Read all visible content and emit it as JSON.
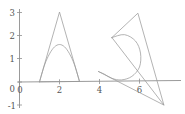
{
  "figure": {
    "title": "",
    "width_px": 185,
    "height_px": 114,
    "background_color": "#ffffff",
    "axis_color": "#8f8f8f",
    "curve_color": "#9a9a9a",
    "label_color": "#555555"
  },
  "axes": {
    "x_label": "",
    "y_label": "",
    "x_ticks": [
      {
        "value": 0,
        "label": "0"
      },
      {
        "value": 2,
        "label": "2"
      },
      {
        "value": 4,
        "label": "4"
      },
      {
        "value": 6,
        "label": "6"
      }
    ],
    "y_ticks": [
      {
        "value": -1,
        "label": "-1"
      },
      {
        "value": 0,
        "label": "0"
      },
      {
        "value": 1,
        "label": "1"
      },
      {
        "value": 2,
        "label": "2"
      },
      {
        "value": 3,
        "label": "3"
      }
    ],
    "x_range": [
      -0.1,
      8.0
    ],
    "y_range": [
      -1.4,
      3.4
    ],
    "grid": false,
    "legend": "none"
  },
  "chart_data": {
    "type": "line",
    "title": "",
    "xlabel": "",
    "ylabel": "",
    "xlim": [
      -0.1,
      8.0
    ],
    "ylim": [
      -1.4,
      3.4
    ],
    "grid": false,
    "legend_position": "none",
    "series": [
      {
        "name": "left-triangle",
        "shape": "closed polyline",
        "closed": true,
        "points": [
          [
            1.0,
            0.0
          ],
          [
            2.0,
            3.0
          ],
          [
            3.0,
            0.0
          ],
          [
            1.0,
            0.0
          ]
        ]
      },
      {
        "name": "left-arch",
        "shape": "smooth arch",
        "closed": false,
        "points": [
          [
            1.0,
            0.0
          ],
          [
            1.25,
            0.72
          ],
          [
            1.5,
            1.2
          ],
          [
            1.75,
            1.5
          ],
          [
            2.0,
            1.6
          ],
          [
            2.25,
            1.5
          ],
          [
            2.5,
            1.2
          ],
          [
            2.75,
            0.72
          ],
          [
            3.0,
            0.0
          ]
        ]
      },
      {
        "name": "right-triangle",
        "shape": "closed polyline",
        "closed": true,
        "points": [
          [
            4.62,
            1.88
          ],
          [
            5.92,
            2.92
          ],
          [
            7.22,
            -1.05
          ],
          [
            4.62,
            1.88
          ]
        ]
      },
      {
        "name": "right-baseline",
        "shape": "polyline",
        "closed": false,
        "points": [
          [
            3.95,
            0.42
          ],
          [
            7.22,
            -1.05
          ]
        ]
      },
      {
        "name": "right-spiral",
        "shape": "spiral arc",
        "closed": false,
        "points": [
          [
            4.62,
            1.88
          ],
          [
            5.25,
            2.0
          ],
          [
            5.8,
            1.72
          ],
          [
            6.05,
            1.2
          ],
          [
            6.0,
            0.6
          ],
          [
            5.62,
            0.2
          ],
          [
            5.1,
            0.05
          ],
          [
            4.62,
            0.12
          ],
          [
            4.25,
            0.3
          ],
          [
            3.95,
            0.42
          ]
        ]
      }
    ]
  }
}
